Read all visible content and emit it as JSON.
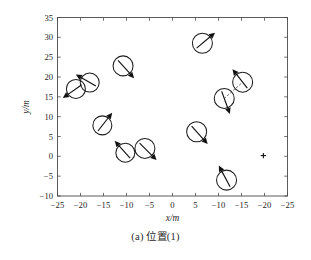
{
  "figure": {
    "caption": "(a) 位置(1)"
  },
  "chart_data": {
    "type": "scatter",
    "title": "",
    "subtitle": "",
    "xlabel": "x/m",
    "ylabel": "y/m",
    "xlim": [
      -25,
      -25
    ],
    "ylim": [
      -10,
      35
    ],
    "grid": false,
    "legend": null,
    "x_tick_labels": [
      "−25",
      "−20",
      "−15",
      "−10",
      "−5",
      "0",
      "5",
      "−10",
      "−15",
      "−20",
      "−25"
    ],
    "y_tick_labels": [
      "35",
      "30",
      "25",
      "20",
      "15",
      "10",
      "5",
      "0",
      "−5",
      "−10"
    ],
    "x_tick_values": [
      0,
      1,
      2,
      3,
      4,
      5,
      6,
      7,
      8,
      9,
      10
    ],
    "y_tick_values": [
      35,
      30,
      25,
      20,
      15,
      10,
      5,
      0,
      -5,
      -10
    ],
    "series": [
      {
        "name": "agents",
        "marker": "circle-with-heading-arrow",
        "points": [
          {
            "id": "agent-1",
            "x_index": 0.8,
            "y": 17.0,
            "heading_deg": 215,
            "radius_px": 9.5
          },
          {
            "id": "agent-2",
            "x_index": 1.4,
            "y": 18.6,
            "heading_deg": 150,
            "radius_px": 9.5
          },
          {
            "id": "agent-3",
            "x_index": 2.85,
            "y": 22.8,
            "heading_deg": 312,
            "radius_px": 10.0
          },
          {
            "id": "agent-4",
            "x_index": 6.3,
            "y": 28.5,
            "heading_deg": 40,
            "radius_px": 10.0
          },
          {
            "id": "agent-5",
            "x_index": 1.95,
            "y": 7.8,
            "heading_deg": 52,
            "radius_px": 9.5
          },
          {
            "id": "agent-6",
            "x_index": 2.95,
            "y": 0.9,
            "heading_deg": 132,
            "radius_px": 9.5
          },
          {
            "id": "agent-7",
            "x_index": 3.8,
            "y": 2.0,
            "heading_deg": 315,
            "radius_px": 10.0
          },
          {
            "id": "agent-8",
            "x_index": 6.05,
            "y": 6.2,
            "heading_deg": 312,
            "radius_px": 10.0
          },
          {
            "id": "agent-9",
            "x_index": 7.25,
            "y": 14.6,
            "heading_deg": 290,
            "radius_px": 10.0
          },
          {
            "id": "agent-10",
            "x_index": 8.05,
            "y": 18.7,
            "heading_deg": 128,
            "radius_px": 10.0
          },
          {
            "id": "agent-11",
            "x_index": 7.35,
            "y": -6.0,
            "heading_deg": 118,
            "radius_px": 10.0
          }
        ]
      },
      {
        "name": "goal",
        "marker": "plus",
        "points": [
          {
            "id": "goal-1",
            "x_index": 8.95,
            "y": 0.2
          }
        ]
      }
    ],
    "links": [
      {
        "from": "agent-9",
        "to": "agent-10",
        "style": "dashed"
      }
    ]
  }
}
